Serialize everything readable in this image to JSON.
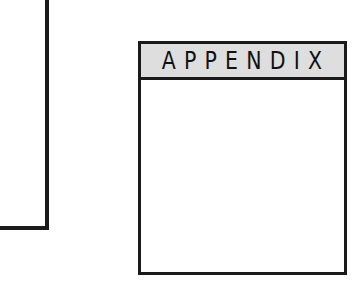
{
  "appendix": {
    "title": "APPENDIX"
  },
  "colors": {
    "border": "#1a1a1a",
    "header_background": "#dedede",
    "page_background": "#ffffff"
  }
}
